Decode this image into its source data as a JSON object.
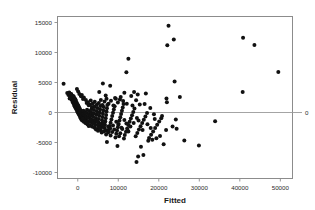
{
  "chart_data": {
    "type": "scatter",
    "title": "",
    "xlabel": "Fitted",
    "ylabel": "Residual",
    "xlim": [
      -5000,
      53000
    ],
    "ylim": [
      -11000,
      16000
    ],
    "xticks": [
      0,
      10000,
      20000,
      30000,
      40000,
      50000
    ],
    "xticklabels": [
      "0",
      "10000",
      "20000",
      "30000",
      "40000",
      "50000"
    ],
    "yticks": [
      -10000,
      -5000,
      0,
      5000,
      10000,
      15000
    ],
    "yticklabels": [
      "-10000",
      "-5000",
      "0",
      "5000",
      "10000",
      "15000"
    ],
    "grid": false,
    "legend": null,
    "reference_line": {
      "orientation": "horizontal",
      "value": 0,
      "label": "0",
      "color": "#9a9a9a"
    },
    "marker": {
      "shape": "circle",
      "color": "#111111",
      "size": 2.0
    },
    "series": [
      {
        "name": "Residuals",
        "points": [
          [
            -3500,
            4800
          ],
          [
            -2600,
            3250
          ],
          [
            -2300,
            2900
          ],
          [
            -2100,
            3350
          ],
          [
            -1900,
            2750
          ],
          [
            -1800,
            3050
          ],
          [
            -1700,
            2400
          ],
          [
            -1600,
            2650
          ],
          [
            -1500,
            2150
          ],
          [
            -1450,
            2850
          ],
          [
            -1350,
            1950
          ],
          [
            -1300,
            2450
          ],
          [
            -1200,
            1700
          ],
          [
            -1150,
            2250
          ],
          [
            -1050,
            1500
          ],
          [
            -1000,
            2050
          ],
          [
            -950,
            2600
          ],
          [
            -900,
            1250
          ],
          [
            -850,
            1800
          ],
          [
            -800,
            2350
          ],
          [
            -750,
            1050
          ],
          [
            -700,
            1600
          ],
          [
            -650,
            2150
          ],
          [
            -600,
            850
          ],
          [
            -550,
            1400
          ],
          [
            -500,
            1950
          ],
          [
            -450,
            650
          ],
          [
            -400,
            1200
          ],
          [
            -350,
            1750
          ],
          [
            -300,
            450
          ],
          [
            -250,
            1000
          ],
          [
            -200,
            1550
          ],
          [
            -150,
            250
          ],
          [
            -100,
            800
          ],
          [
            -50,
            1350
          ],
          [
            0,
            50
          ],
          [
            50,
            600
          ],
          [
            100,
            1150
          ],
          [
            150,
            -150
          ],
          [
            200,
            400
          ],
          [
            250,
            950
          ],
          [
            300,
            -350
          ],
          [
            350,
            200
          ],
          [
            400,
            750
          ],
          [
            450,
            -550
          ],
          [
            500,
            0
          ],
          [
            550,
            550
          ],
          [
            600,
            -750
          ],
          [
            650,
            -200
          ],
          [
            700,
            350
          ],
          [
            750,
            -950
          ],
          [
            800,
            -400
          ],
          [
            850,
            150
          ],
          [
            900,
            -1150
          ],
          [
            950,
            -600
          ],
          [
            1000,
            -50
          ],
          [
            1100,
            -1350
          ],
          [
            1200,
            -800
          ],
          [
            1300,
            -250
          ],
          [
            1400,
            300
          ],
          [
            1500,
            -1550
          ],
          [
            1600,
            -1000
          ],
          [
            1700,
            -450
          ],
          [
            1800,
            100
          ],
          [
            1900,
            -1750
          ],
          [
            2000,
            -1200
          ],
          [
            2100,
            -650
          ],
          [
            2200,
            -100
          ],
          [
            2300,
            450
          ],
          [
            2400,
            -1950
          ],
          [
            2500,
            -1400
          ],
          [
            2600,
            -850
          ],
          [
            2700,
            -300
          ],
          [
            2800,
            250
          ],
          [
            2900,
            -2150
          ],
          [
            3000,
            -1600
          ],
          [
            3100,
            -1050
          ],
          [
            3200,
            -500
          ],
          [
            3300,
            50
          ],
          [
            3400,
            600
          ],
          [
            3500,
            -2350
          ],
          [
            3600,
            -1800
          ],
          [
            3700,
            -1250
          ],
          [
            3800,
            -700
          ],
          [
            3900,
            -150
          ],
          [
            4000,
            400
          ],
          [
            4100,
            950
          ],
          [
            4200,
            -2550
          ],
          [
            4300,
            -2000
          ],
          [
            4400,
            -1450
          ],
          [
            4500,
            -900
          ],
          [
            4600,
            -350
          ],
          [
            4700,
            200
          ],
          [
            4800,
            750
          ],
          [
            4900,
            -2750
          ],
          [
            5000,
            -2200
          ],
          [
            5100,
            -1650
          ],
          [
            5200,
            -1100
          ],
          [
            5300,
            -550
          ],
          [
            5400,
            0
          ],
          [
            5500,
            550
          ],
          [
            5600,
            1100
          ],
          [
            5700,
            -2950
          ],
          [
            5800,
            -2400
          ],
          [
            5900,
            -1850
          ],
          [
            6000,
            -1300
          ],
          [
            6100,
            -750
          ],
          [
            6200,
            -200
          ],
          [
            6300,
            350
          ],
          [
            6400,
            900
          ],
          [
            6500,
            -3150
          ],
          [
            6600,
            -2600
          ],
          [
            6700,
            -2050
          ],
          [
            6800,
            -1500
          ],
          [
            6900,
            -950
          ],
          [
            7000,
            -400
          ],
          [
            7100,
            150
          ],
          [
            7200,
            700
          ],
          [
            7300,
            1250
          ],
          [
            6200,
            4850
          ],
          [
            5300,
            3400
          ],
          [
            6900,
            2850
          ],
          [
            7500,
            -3350
          ],
          [
            7700,
            -2800
          ],
          [
            7900,
            -2250
          ],
          [
            8100,
            -1700
          ],
          [
            8300,
            -1150
          ],
          [
            8500,
            -600
          ],
          [
            8700,
            -50
          ],
          [
            8900,
            500
          ],
          [
            9100,
            1050
          ],
          [
            8000,
            4450
          ],
          [
            9500,
            -3550
          ],
          [
            9700,
            -3000
          ],
          [
            9900,
            -2450
          ],
          [
            10100,
            -1900
          ],
          [
            10300,
            -1350
          ],
          [
            10500,
            -800
          ],
          [
            10700,
            -250
          ],
          [
            10900,
            300
          ],
          [
            11100,
            850
          ],
          [
            11300,
            1400
          ],
          [
            7200,
            -4900
          ],
          [
            9800,
            -5600
          ],
          [
            9400,
            2300
          ],
          [
            10600,
            2600
          ],
          [
            11600,
            -3750
          ],
          [
            11900,
            -3200
          ],
          [
            12200,
            -2650
          ],
          [
            12500,
            -2100
          ],
          [
            12800,
            -1550
          ],
          [
            13100,
            -1000
          ],
          [
            13400,
            -450
          ],
          [
            13700,
            100
          ],
          [
            14000,
            650
          ],
          [
            12000,
            6700
          ],
          [
            12500,
            8950
          ],
          [
            11500,
            3300
          ],
          [
            13200,
            2750
          ],
          [
            14300,
            -3950
          ],
          [
            14700,
            -3400
          ],
          [
            15100,
            -2850
          ],
          [
            15500,
            -2300
          ],
          [
            15900,
            -1750
          ],
          [
            16300,
            -1200
          ],
          [
            16700,
            -650
          ],
          [
            17100,
            -100
          ],
          [
            14500,
            -8250
          ],
          [
            14900,
            -7350
          ],
          [
            15600,
            -5700
          ],
          [
            16200,
            -7100
          ],
          [
            13900,
            3400
          ],
          [
            14400,
            2050
          ],
          [
            15300,
            1350
          ],
          [
            14800,
            3000
          ],
          [
            17600,
            -4250
          ],
          [
            18100,
            -3700
          ],
          [
            18600,
            -3150
          ],
          [
            19100,
            -2600
          ],
          [
            19600,
            -2050
          ],
          [
            20100,
            -1500
          ],
          [
            20600,
            -950
          ],
          [
            17400,
            -4700
          ],
          [
            18400,
            -4550
          ],
          [
            19400,
            -4300
          ],
          [
            16800,
            3150
          ],
          [
            17900,
            750
          ],
          [
            18800,
            -300
          ],
          [
            21200,
            -5300
          ],
          [
            21800,
            -2900
          ],
          [
            22400,
            14450
          ],
          [
            22100,
            11200
          ],
          [
            22000,
            1700
          ],
          [
            23700,
            12150
          ],
          [
            23900,
            5150
          ],
          [
            23400,
            -2350
          ],
          [
            24200,
            -1150
          ],
          [
            24400,
            -2700
          ],
          [
            21900,
            2350
          ],
          [
            25200,
            2600
          ],
          [
            26300,
            -4650
          ],
          [
            29900,
            -5500
          ],
          [
            33900,
            -1450
          ],
          [
            40800,
            12450
          ],
          [
            40700,
            3400
          ],
          [
            43600,
            11250
          ],
          [
            49500,
            6750
          ],
          [
            1000,
            2900
          ],
          [
            1500,
            2500
          ],
          [
            2000,
            2100
          ],
          [
            2500,
            1700
          ],
          [
            3000,
            1300
          ],
          [
            3500,
            900
          ],
          [
            4000,
            -2450
          ],
          [
            4500,
            -2850
          ],
          [
            5000,
            -3050
          ],
          [
            5500,
            -1950
          ],
          [
            6000,
            -2250
          ],
          [
            6500,
            -1750
          ],
          [
            7000,
            -2950
          ],
          [
            7500,
            -2350
          ],
          [
            8000,
            -2650
          ],
          [
            8500,
            -3250
          ],
          [
            9000,
            -2850
          ],
          [
            9500,
            -1550
          ],
          [
            10000,
            -2050
          ],
          [
            10500,
            -3450
          ],
          [
            11000,
            -2750
          ],
          [
            11500,
            -1250
          ],
          [
            12000,
            -1850
          ],
          [
            12500,
            -3150
          ],
          [
            13000,
            -2350
          ],
          [
            2200,
            1600
          ],
          [
            2700,
            1200
          ],
          [
            3200,
            2000
          ],
          [
            3700,
            1500
          ],
          [
            4200,
            1800
          ],
          [
            4700,
            1300
          ],
          [
            5200,
            1600
          ],
          [
            5700,
            2100
          ],
          [
            6100,
            1250
          ],
          [
            6600,
            1850
          ],
          [
            7100,
            2300
          ],
          [
            7600,
            1450
          ],
          [
            8200,
            1950
          ],
          [
            8800,
            1150
          ],
          [
            9200,
            2400
          ],
          [
            9900,
            1650
          ],
          [
            10400,
            2150
          ],
          [
            11200,
            1900
          ],
          [
            12100,
            1450
          ],
          [
            13500,
            1150
          ],
          [
            1200,
            -1050
          ],
          [
            1700,
            -1450
          ],
          [
            2200,
            -1850
          ],
          [
            2700,
            -2250
          ],
          [
            3300,
            -1350
          ],
          [
            3800,
            -1650
          ],
          [
            4300,
            -1250
          ],
          [
            4900,
            -1550
          ],
          [
            5400,
            -2550
          ],
          [
            5900,
            -3350
          ],
          [
            6400,
            -2450
          ],
          [
            7000,
            -3650
          ],
          [
            7600,
            -3150
          ],
          [
            8100,
            -3850
          ],
          [
            8700,
            -2150
          ],
          [
            9300,
            -4150
          ],
          [
            10200,
            -3950
          ],
          [
            10800,
            -2550
          ],
          [
            11400,
            -4350
          ],
          [
            12300,
            -2950
          ],
          [
            1300,
            2250
          ],
          [
            800,
            2700
          ],
          [
            400,
            3100
          ],
          [
            100,
            3500
          ],
          [
            -200,
            3900
          ],
          [
            -600,
            2200
          ],
          [
            -1100,
            2750
          ],
          [
            -1600,
            3100
          ],
          [
            -2000,
            2350
          ],
          [
            16500,
            1400
          ],
          [
            17200,
            -1950
          ],
          [
            18000,
            -2600
          ],
          [
            19000,
            -1100
          ],
          [
            20300,
            -3900
          ],
          [
            20800,
            -600
          ],
          [
            15000,
            -1350
          ],
          [
            13800,
            -1750
          ],
          [
            14600,
            -900
          ],
          [
            16000,
            -2900
          ]
        ]
      }
    ]
  },
  "axis_titles": {
    "x": "Fitted",
    "y": "Residual"
  },
  "reference_label": "0"
}
